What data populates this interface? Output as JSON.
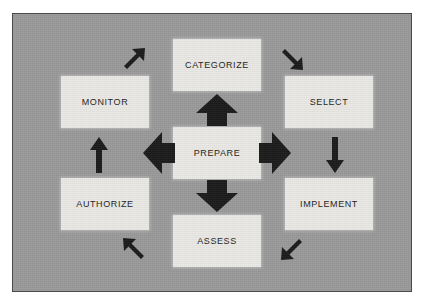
{
  "diagram": {
    "canvas": {
      "background_color": "#9a9a9a",
      "border_color": "#4a4a4a",
      "page_background": "#ffffff"
    },
    "style": {
      "box_fill": "#ebeae6",
      "label_color": "#1d1d1d",
      "arrow_color": "#1b1b1b"
    },
    "nodes": [
      {
        "id": "categorize",
        "label": "CATEGORIZE",
        "position": "top"
      },
      {
        "id": "monitor",
        "label": "MONITOR",
        "position": "top-left"
      },
      {
        "id": "select",
        "label": "SELECT",
        "position": "top-right"
      },
      {
        "id": "prepare",
        "label": "PREPARE",
        "position": "center"
      },
      {
        "id": "authorize",
        "label": "AUTHORIZE",
        "position": "bottom-left"
      },
      {
        "id": "implement",
        "label": "IMPLEMENT",
        "position": "bottom-right"
      },
      {
        "id": "assess",
        "label": "ASSESS",
        "position": "bottom"
      }
    ],
    "center_arrows": [
      {
        "id": "center-up",
        "icon": "thick-arrow-up-icon",
        "direction": "up",
        "from": "prepare",
        "to": "categorize"
      },
      {
        "id": "center-down",
        "icon": "thick-arrow-down-icon",
        "direction": "down",
        "from": "prepare",
        "to": "assess"
      },
      {
        "id": "center-left",
        "icon": "thick-arrow-left-icon",
        "direction": "left",
        "from": "prepare",
        "to": "monitor-authorize"
      },
      {
        "id": "center-right",
        "icon": "thick-arrow-right-icon",
        "direction": "right",
        "from": "prepare",
        "to": "select-implement"
      }
    ],
    "cycle_arrows": [
      {
        "id": "diag-ne",
        "icon": "arrow-up-right-icon",
        "direction": "up-right",
        "from": "monitor",
        "to": "categorize"
      },
      {
        "id": "diag-se",
        "icon": "arrow-down-right-icon",
        "direction": "down-right",
        "from": "categorize",
        "to": "select"
      },
      {
        "id": "right-down",
        "icon": "arrow-down-icon",
        "direction": "down",
        "from": "select",
        "to": "implement"
      },
      {
        "id": "diag-sw",
        "icon": "arrow-down-left-icon",
        "direction": "down-left",
        "from": "implement",
        "to": "assess"
      },
      {
        "id": "diag-nw",
        "icon": "arrow-up-left-icon",
        "direction": "up-left",
        "from": "assess",
        "to": "authorize"
      },
      {
        "id": "left-up",
        "icon": "arrow-up-icon",
        "direction": "up",
        "from": "authorize",
        "to": "monitor"
      }
    ]
  }
}
